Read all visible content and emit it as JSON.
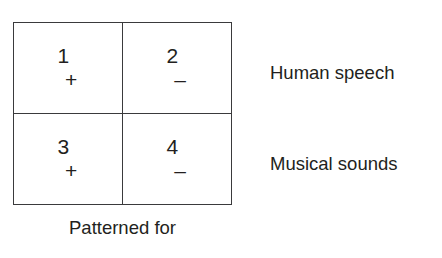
{
  "figure": {
    "matrix": {
      "cells": [
        {
          "number": "1",
          "sign": "+"
        },
        {
          "number": "2",
          "sign": "–"
        },
        {
          "number": "3",
          "sign": "+"
        },
        {
          "number": "4",
          "sign": "–"
        }
      ]
    },
    "row_labels": [
      {
        "text": "Human speech"
      },
      {
        "text": "Musical sounds"
      }
    ],
    "caption": {
      "line1": "Patterned for",
      "line2": ""
    },
    "colors": {
      "border": "#3a3a3c",
      "text": "#231f20",
      "background": "#ffffff"
    }
  }
}
